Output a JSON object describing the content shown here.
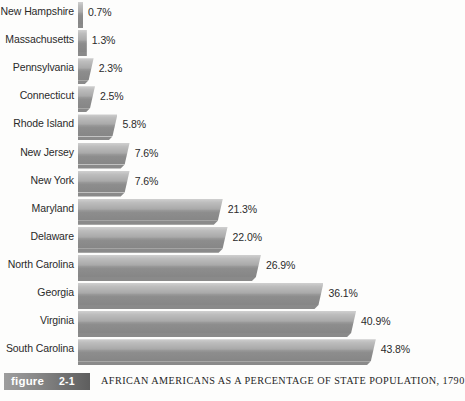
{
  "figure": {
    "tag_word": "figure",
    "tag_number": "2-1",
    "caption": "AFRICAN AMERICANS AS A PERCENTAGE OF STATE POPULATION, 1790"
  },
  "chart_data": {
    "type": "bar",
    "orientation": "horizontal",
    "title": "AFRICAN AMERICANS AS A PERCENTAGE OF STATE POPULATION, 1790",
    "xlabel": "",
    "ylabel": "",
    "xlim": [
      0,
      43.8
    ],
    "grid": false,
    "legend": false,
    "value_suffix": "%",
    "categories": [
      "New Hampshire",
      "Massachusetts",
      "Pennsylvania",
      "Connecticut",
      "Rhode Island",
      "New Jersey",
      "New York",
      "Maryland",
      "Delaware",
      "North Carolina",
      "Georgia",
      "Virginia",
      "South Carolina"
    ],
    "values": [
      0.7,
      1.3,
      2.3,
      2.5,
      5.8,
      7.6,
      7.6,
      21.3,
      22.0,
      26.9,
      36.1,
      40.9,
      43.8
    ],
    "value_labels": [
      "0.7%",
      "1.3%",
      "2.3%",
      "2.5%",
      "5.8%",
      "7.6%",
      "7.6%",
      "21.3%",
      "22.0%",
      "26.9%",
      "36.1%",
      "40.9%",
      "43.8%"
    ],
    "colors": {
      "bar_light": "#d0d0d0",
      "bar_mid": "#a9a9a9",
      "bar_dark": "#868686",
      "bar_shadow": "#8a8a8a",
      "text": "#2a2a2a",
      "background": "#fdfdfc",
      "tag_background": "#7d7d7d",
      "tag_text": "#ffffff"
    }
  }
}
